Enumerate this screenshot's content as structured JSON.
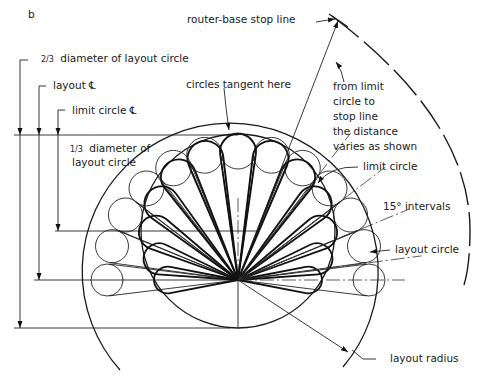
{
  "figure_label": "b",
  "labels": {
    "stop_line": "router-base stop line",
    "two_thirds": "diameter of layout circle",
    "two_thirds_frac": "2/3",
    "layout_cl": "layout ℄",
    "limit_cl": "limit circle ℄",
    "one_third_line1": "diameter of",
    "one_third_frac": "1/3",
    "one_third_line2": "layout circle",
    "tangent": "circles tangent here",
    "from_limit": [
      "from limit",
      "circle to",
      "stop line",
      "the distance",
      "varies as shown"
    ],
    "limit_circle": "limit circle",
    "intervals": "15° intervals",
    "layout_circle": "layout circle",
    "layout_radius": "layout radius"
  },
  "geometry_semantics": {
    "interval_degrees": 15,
    "circle_count": 13
  }
}
